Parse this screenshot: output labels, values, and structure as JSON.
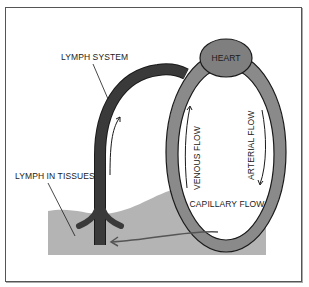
{
  "diagram": {
    "labels": {
      "lymph_system": "LYMPH SYSTEM",
      "heart": "HEART",
      "venous_flow": "VENOUS FLOW",
      "arterial_flow": "ARTERIAL FLOW",
      "lymph_in_tissues": "LYMPH IN TISSUES",
      "capillary_flow": "CAPILLARY FLOW"
    },
    "colors": {
      "lymph_vessel": "#3a3a3a",
      "blood_loop": "#8a8a8a",
      "heart": "#7f7f7f",
      "tissue": "#b4b4b4",
      "outline": "#1a1a1a",
      "background": "#ffffff",
      "frame": "#555555"
    }
  }
}
